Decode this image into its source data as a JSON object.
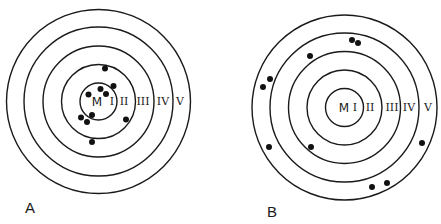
{
  "figure": {
    "type": "concentric-zone diagram",
    "ring_labels": [
      "M",
      "I",
      "II",
      "III",
      "IV",
      "V"
    ],
    "panels": [
      {
        "id": "A",
        "label": "A",
        "dot_count": 10,
        "dots_by_zone": {
          "I": 5,
          "II": 5,
          "III": 0,
          "IV": 0,
          "V": 0
        }
      },
      {
        "id": "B",
        "label": "B",
        "dot_count": 10,
        "dots_by_zone": {
          "I": 0,
          "II": 0,
          "III": 1,
          "IV": 3,
          "V": 6
        }
      }
    ]
  },
  "colors": {
    "line": "#1a1a1a",
    "dot": "#111111",
    "background": "#ffffff"
  }
}
